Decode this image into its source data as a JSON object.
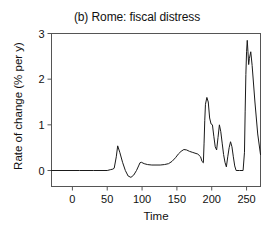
{
  "chart_data": {
    "type": "line",
    "title": "(b) Rome: fiscal distress",
    "xlabel": "Time",
    "ylabel": "Rate of change (% per y)",
    "xlim": [
      -30,
      270
    ],
    "ylim": [
      -0.35,
      3
    ],
    "xticks": [
      0,
      50,
      100,
      150,
      200,
      250
    ],
    "xtick_labels": [
      "0",
      "50",
      "100",
      "150",
      "200",
      "250"
    ],
    "yticks": [
      0,
      1,
      2,
      3
    ],
    "ytick_labels": [
      "0",
      "1",
      "2",
      "3"
    ],
    "grid": false,
    "legend": "none",
    "line_color": "#1a1a1a",
    "axis_color": "#555555",
    "background": "#ffffff",
    "series": [
      {
        "name": "rate-of-change",
        "x": [
          -30,
          10,
          30,
          50,
          55,
          58,
          60,
          63,
          65,
          68,
          72,
          76,
          80,
          84,
          88,
          92,
          95,
          97,
          99,
          103,
          108,
          114,
          120,
          126,
          132,
          138,
          143,
          148,
          152,
          156,
          160,
          164,
          168,
          172,
          176,
          180,
          184,
          186,
          188,
          189,
          190,
          191,
          193,
          195,
          197,
          199,
          201,
          203,
          205,
          207,
          209,
          211,
          213,
          215,
          217,
          219,
          221,
          223,
          225,
          227,
          229,
          231,
          233,
          235,
          240,
          245,
          247,
          248,
          249,
          250,
          251,
          252,
          253,
          254,
          256,
          258,
          262,
          266,
          270
        ],
        "y": [
          0.0,
          0.0,
          0.0,
          0.0,
          0.02,
          0.03,
          0.05,
          0.3,
          0.54,
          0.4,
          0.18,
          0.0,
          -0.12,
          -0.15,
          -0.1,
          0.0,
          0.1,
          0.17,
          0.18,
          0.15,
          0.13,
          0.12,
          0.12,
          0.12,
          0.13,
          0.15,
          0.2,
          0.28,
          0.36,
          0.42,
          0.46,
          0.45,
          0.42,
          0.4,
          0.38,
          0.36,
          0.3,
          0.2,
          0.17,
          0.6,
          1.1,
          1.45,
          1.6,
          1.5,
          1.15,
          1.02,
          1.0,
          0.75,
          0.52,
          0.45,
          0.72,
          1.0,
          0.85,
          0.6,
          0.35,
          0.18,
          0.08,
          0.3,
          0.5,
          0.63,
          0.52,
          0.3,
          0.1,
          0.0,
          0.0,
          0.0,
          0.4,
          1.3,
          2.1,
          2.6,
          2.85,
          2.6,
          2.32,
          2.45,
          2.6,
          2.3,
          1.5,
          0.8,
          0.35
        ]
      }
    ]
  }
}
